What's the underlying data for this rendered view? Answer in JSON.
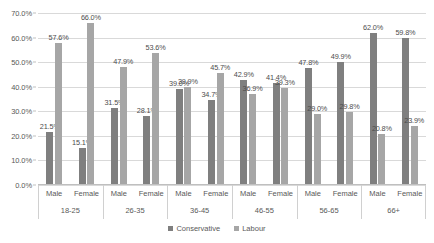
{
  "chart_data": {
    "type": "bar",
    "title": "",
    "subtitle": "",
    "xlabel": "",
    "ylabel": "",
    "ylim": [
      0,
      70
    ],
    "y_tick_labels": [
      "0.0%",
      "10.0%",
      "20.0%",
      "30.0%",
      "40.0%",
      "50.0%",
      "60.0%",
      "70.0%"
    ],
    "y_tick_values": [
      0,
      10,
      20,
      30,
      40,
      50,
      60,
      70
    ],
    "grid": true,
    "legend_position": "bottom",
    "group_labels": [
      "18-25",
      "26-35",
      "36-45",
      "46-55",
      "56-65",
      "66+"
    ],
    "subgroup_labels": [
      "Male",
      "Female"
    ],
    "categories": [
      "18-25 Male",
      "18-25 Female",
      "26-35 Male",
      "26-35 Female",
      "36-45 Male",
      "36-45 Female",
      "46-55 Male",
      "46-55 Female",
      "56-65 Male",
      "56-65 Female",
      "66+ Male",
      "66+ Female"
    ],
    "series": [
      {
        "name": "Conservative",
        "color": "#7f7f7f",
        "values": [
          21.5,
          15.1,
          31.5,
          28.1,
          39.0,
          34.7,
          42.9,
          41.4,
          47.8,
          49.9,
          62.0,
          59.8
        ],
        "value_labels": [
          "21.5%",
          "15.1%",
          "31.5%",
          "28.1%",
          "39.0%",
          "34.7%",
          "42.9%",
          "41.4%",
          "47.8%",
          "49.9%",
          "62.0%",
          "59.8%"
        ]
      },
      {
        "name": "Labour",
        "color": "#a6a6a6",
        "values": [
          57.6,
          66.0,
          47.9,
          53.6,
          39.9,
          45.7,
          36.9,
          39.3,
          29.0,
          29.8,
          20.8,
          23.9
        ],
        "value_labels": [
          "57.6%",
          "66.0%",
          "47.9%",
          "53.6%",
          "39.9%",
          "45.7%",
          "36.9%",
          "39.3%",
          "29.0%",
          "29.8%",
          "20.8%",
          "23.9%"
        ]
      }
    ]
  },
  "legend": {
    "items": [
      {
        "label": "Conservative",
        "color": "#7f7f7f"
      },
      {
        "label": "Labour",
        "color": "#a6a6a6"
      }
    ]
  }
}
